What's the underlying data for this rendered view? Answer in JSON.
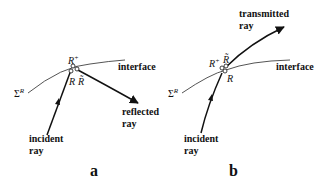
{
  "panels": [
    {
      "id": "a",
      "label": "a",
      "interface_label": "interface",
      "surface_label": "Σ",
      "surface_sup": "R",
      "incident_label_1": "incident",
      "incident_label_2": "ray",
      "outgoing_label_1": "reflected",
      "outgoing_label_2": "ray",
      "point_top": "R",
      "point_top_sup": "+",
      "point_left": "R",
      "point_right": "R̃"
    },
    {
      "id": "b",
      "label": "b",
      "interface_label": "interface",
      "surface_label": "Σ",
      "surface_sup": "R",
      "incident_label_1": "incident",
      "incident_label_2": "ray",
      "outgoing_label_1": "transmitted",
      "outgoing_label_2": "ray",
      "point_top": "R",
      "point_top_sup": "+",
      "point_mid": "R̃",
      "point_bottom": "R"
    }
  ],
  "colors": {
    "stroke": "#111111",
    "interface": "#555555"
  }
}
